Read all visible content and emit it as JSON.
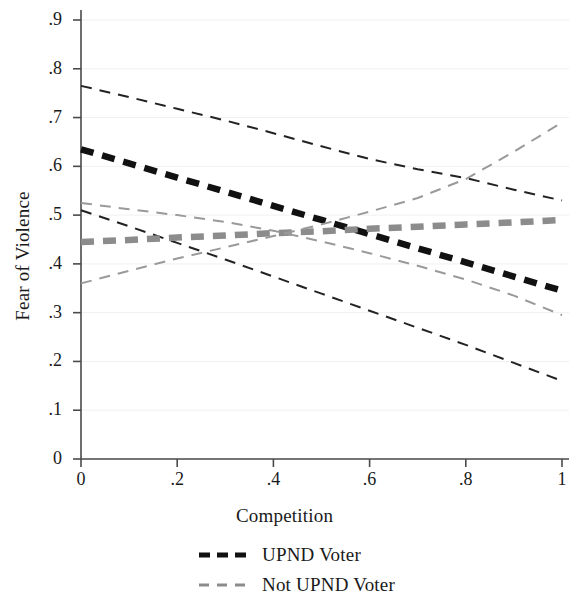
{
  "chart_data": {
    "type": "line",
    "title": "",
    "xlabel": "Competition",
    "ylabel": "Fear of Violence",
    "xlim": [
      0,
      1
    ],
    "ylim": [
      0,
      0.9
    ],
    "x_ticks": [
      "0",
      ".2",
      ".4",
      ".6",
      ".8",
      "1"
    ],
    "x_tick_values": [
      0,
      0.2,
      0.4,
      0.6,
      0.8,
      1
    ],
    "y_ticks": [
      "0",
      ".1",
      ".2",
      ".3",
      ".4",
      ".5",
      ".6",
      ".7",
      ".8",
      ".9"
    ],
    "y_tick_values": [
      0,
      0.1,
      0.2,
      0.3,
      0.4,
      0.5,
      0.6,
      0.7,
      0.8,
      0.9
    ],
    "grid": "faint horizontal gridlines at each y tick",
    "legend_position": "below plot, centered",
    "x": [
      0,
      0.1,
      0.2,
      0.3,
      0.4,
      0.5,
      0.6,
      0.7,
      0.8,
      0.9,
      1
    ],
    "series": [
      {
        "name": "UPND Voter",
        "role": "estimate",
        "color": "#111111",
        "style": "thick-dashed",
        "values": [
          0.635,
          0.606,
          0.577,
          0.548,
          0.519,
          0.49,
          0.461,
          0.432,
          0.403,
          0.374,
          0.345
        ]
      },
      {
        "name": "UPND Voter upper CI",
        "role": "upper-ci",
        "color": "#222222",
        "style": "thin-dashed",
        "values": [
          0.765,
          0.742,
          0.718,
          0.694,
          0.668,
          0.641,
          0.615,
          0.594,
          0.576,
          0.552,
          0.53
        ]
      },
      {
        "name": "UPND Voter lower CI",
        "role": "lower-ci",
        "color": "#222222",
        "style": "thin-dashed",
        "values": [
          0.51,
          0.477,
          0.443,
          0.409,
          0.374,
          0.339,
          0.304,
          0.269,
          0.234,
          0.197,
          0.16
        ]
      },
      {
        "name": "Not UPND Voter",
        "role": "estimate",
        "color": "#8c8c8c",
        "style": "thick-dashed",
        "values": [
          0.445,
          0.449,
          0.454,
          0.458,
          0.463,
          0.467,
          0.472,
          0.476,
          0.481,
          0.485,
          0.49
        ]
      },
      {
        "name": "Not UPND Voter upper CI",
        "role": "upper-ci",
        "color": "#9a9a9a",
        "style": "thin-dashed",
        "values": [
          0.36,
          0.386,
          0.411,
          0.434,
          0.457,
          0.481,
          0.507,
          0.535,
          0.574,
          0.63,
          0.69
        ]
      },
      {
        "name": "Not UPND Voter lower CI",
        "role": "lower-ci",
        "color": "#9a9a9a",
        "style": "thin-dashed",
        "values": [
          0.525,
          0.512,
          0.5,
          0.486,
          0.468,
          0.446,
          0.422,
          0.396,
          0.368,
          0.335,
          0.295
        ]
      }
    ],
    "legend": [
      {
        "label": "UPND Voter",
        "color": "#111111",
        "style": "thick-dashed"
      },
      {
        "label": "Not UPND Voter",
        "color": "#8c8c8c",
        "style": "thin-dashed"
      }
    ]
  },
  "colors": {
    "axis": "#4a4a4a",
    "grid": "#f0f0f0",
    "black_series": "#111111",
    "gray_series": "#8c8c8c",
    "background": "#ffffff"
  }
}
